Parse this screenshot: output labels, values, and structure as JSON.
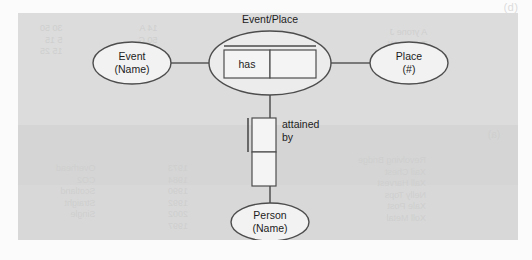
{
  "figure": {
    "corner_marker": "(b)",
    "inner_corner_marker": "(a)",
    "bleed_text": {
      "top_left": "30 50\n5 15\n15 25",
      "top_middle": "14 A\n50 G\n20 B",
      "top_right": "A yrone J\nT rome W\n15 M",
      "bottom_left": "Overhead\nCO2\nScotland\nStraight\nSingle",
      "bottom_middle": "1973\n1984\n1990\n1992\n2002\n1997",
      "bottom_right": "Revolving Bridge\nXail Chest\nXall Harvest\nNelly Tops\nXale Post\nXoll Metal"
    }
  },
  "diagram": {
    "type": "orm-entity-relationship",
    "entities": [
      {
        "id": "event",
        "line1": "Event",
        "line2": "(Name)"
      },
      {
        "id": "place",
        "line1": "Place",
        "line2": "(#)"
      },
      {
        "id": "person",
        "line1": "Person",
        "line2": "(Name)"
      }
    ],
    "objectified_fact": {
      "id": "event-place",
      "label": "Event/Place",
      "predicate_cells": [
        "has",
        ""
      ]
    },
    "vertical_predicate": {
      "id": "attained-by",
      "label_line1": "attained",
      "label_line2": "by",
      "cells": [
        "",
        ""
      ]
    }
  }
}
